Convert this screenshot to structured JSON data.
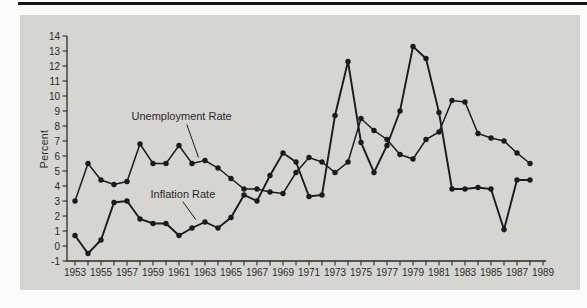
{
  "page": {
    "background_color": "#fbfbf9",
    "top_rule_color": "#161616",
    "panel_color": "#d6d5d1",
    "line_color": "#1b1b1b",
    "text_color": "#2b2b2b"
  },
  "chart_data": {
    "type": "line",
    "title": "",
    "xlabel": "",
    "ylabel": "Percent",
    "ylim": [
      -1,
      14
    ],
    "xlim": [
      1953,
      1989
    ],
    "grid": false,
    "legend": "inline-annotations",
    "marker": "filled-circle",
    "ytick_labels": [
      "14",
      "13",
      "12",
      "11",
      "10",
      "9",
      "8",
      "7",
      "6",
      "5",
      "4",
      "3",
      "2",
      "1",
      "0",
      "-1"
    ],
    "ytick_values": [
      14,
      13,
      12,
      11,
      10,
      9,
      8,
      7,
      6,
      5,
      4,
      3,
      2,
      1,
      0,
      -1
    ],
    "xtick_label_values": [
      1953,
      1955,
      1957,
      1959,
      1961,
      1963,
      1965,
      1967,
      1969,
      1971,
      1973,
      1975,
      1977,
      1979,
      1981,
      1983,
      1985,
      1987,
      1989
    ],
    "xtick_minor_every_year": true,
    "years": [
      1953,
      1954,
      1955,
      1956,
      1957,
      1958,
      1959,
      1960,
      1961,
      1962,
      1963,
      1964,
      1965,
      1966,
      1967,
      1968,
      1969,
      1970,
      1971,
      1972,
      1973,
      1974,
      1975,
      1976,
      1977,
      1978,
      1979,
      1980,
      1981,
      1982,
      1983,
      1984,
      1985,
      1986,
      1987,
      1988
    ],
    "series": [
      {
        "name": "Unemployment Rate",
        "values": [
          3.0,
          5.5,
          4.4,
          4.1,
          4.3,
          6.8,
          5.5,
          5.5,
          6.7,
          5.5,
          5.7,
          5.2,
          4.5,
          3.8,
          3.8,
          3.6,
          3.5,
          4.9,
          5.9,
          5.6,
          4.9,
          5.6,
          8.5,
          7.7,
          7.1,
          6.1,
          5.8,
          7.1,
          7.6,
          9.7,
          9.6,
          7.5,
          7.2,
          7.0,
          6.2,
          5.5
        ]
      },
      {
        "name": "Inflation Rate",
        "values": [
          0.7,
          -0.5,
          0.4,
          2.9,
          3.0,
          1.8,
          1.5,
          1.5,
          0.7,
          1.2,
          1.6,
          1.2,
          1.9,
          3.4,
          3.0,
          4.7,
          6.2,
          5.6,
          3.3,
          3.4,
          8.7,
          12.3,
          6.9,
          4.9,
          6.7,
          9.0,
          13.3,
          12.5,
          8.9,
          3.8,
          3.8,
          3.9,
          3.8,
          1.1,
          4.4,
          4.4
        ]
      }
    ],
    "annotations": [
      {
        "label": "Unemployment Rate",
        "text_year": 1961.2,
        "text_value": 8.7,
        "pointer": {
          "from_year": 1961.6,
          "from_value": 8.1,
          "to_year": 1962.5,
          "to_value": 5.9
        }
      },
      {
        "label": "Inflation Rate",
        "text_year": 1961.3,
        "text_value": 3.5,
        "pointer": {
          "from_year": 1961.3,
          "from_value": 2.95,
          "to_year": 1962.3,
          "to_value": 1.75
        }
      }
    ]
  }
}
